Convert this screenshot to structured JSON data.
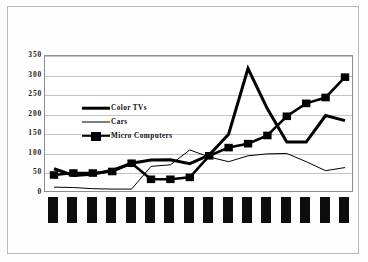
{
  "chart_data": {
    "type": "line",
    "title": "",
    "xlabel": "",
    "ylabel": "",
    "ylim": [
      0,
      350
    ],
    "yticks": [
      0,
      50,
      100,
      150,
      200,
      250,
      300,
      350
    ],
    "ytick_labels": [
      "0",
      "50",
      "100",
      "150",
      "200",
      "250",
      "300",
      "350"
    ],
    "grid": true,
    "legend_position": "upper-left-inside",
    "categories": [
      "",
      "",
      "",
      "",
      "",
      "",
      "",
      "",
      "",
      "",
      "",
      "",
      "",
      "",
      "",
      ""
    ],
    "category_labels_redacted": true,
    "category_count": 16,
    "series": [
      {
        "name": "Color TVs",
        "style": "thick-line",
        "color": "#000000",
        "values": [
          62,
          45,
          48,
          58,
          76,
          84,
          85,
          75,
          97,
          150,
          318,
          215,
          130,
          130,
          198,
          185
        ]
      },
      {
        "name": "Cars",
        "style": "thin-line",
        "color": "#000000",
        "values": [
          15,
          14,
          11,
          10,
          10,
          68,
          72,
          110,
          92,
          80,
          95,
          100,
          101,
          80,
          57,
          65
        ]
      },
      {
        "name": "Micro Computers",
        "style": "line-with-square-markers",
        "color": "#000000",
        "values": [
          46,
          51,
          51,
          55,
          76,
          35,
          35,
          40,
          95,
          116,
          126,
          147,
          196,
          229,
          244,
          296
        ]
      }
    ]
  },
  "legend": {
    "items": [
      {
        "label": "Color TVs",
        "swatch": "thick-line-swatch"
      },
      {
        "label": "Cars",
        "swatch": "thin-line-swatch"
      },
      {
        "label": "Micro Computers",
        "swatch": "square-marker-line-swatch"
      }
    ]
  },
  "colors": {
    "ink": "#000000",
    "grid": "#c3c3c3",
    "axis": "#8d8d8d",
    "page": "#fefefe",
    "frame": "#b9b9b9"
  }
}
